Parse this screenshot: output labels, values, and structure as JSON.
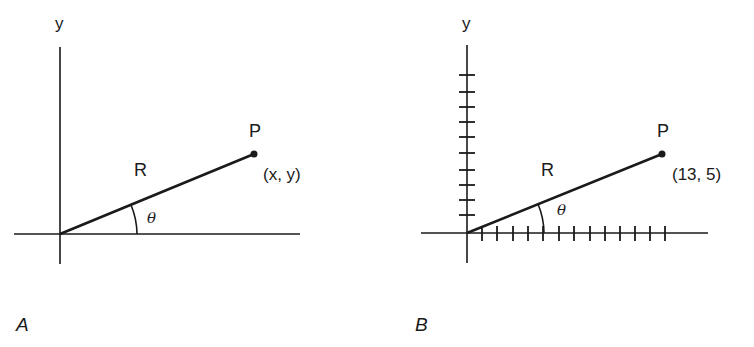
{
  "colors": {
    "ink": "#1a1a1a",
    "background": "#ffffff"
  },
  "panels": [
    {
      "id": "A",
      "panel_label": "A",
      "y_axis_label": "y",
      "point_label": "P",
      "coordinate_label": "(x, y)",
      "radius_label": "R",
      "angle_label": "θ",
      "origin": [
        60,
        234
      ],
      "point": [
        254,
        154
      ],
      "ticks": false
    },
    {
      "id": "B",
      "panel_label": "B",
      "y_axis_label": "y",
      "point_label": "P",
      "coordinate_label": "(13, 5)",
      "radius_label": "R",
      "angle_label": "θ",
      "origin": [
        467,
        233
      ],
      "point": [
        662,
        154
      ],
      "ticks": true,
      "x_tick_count": 13,
      "y_tick_count": 10,
      "tick_spacing": 15.25,
      "point_coords": {
        "x": 13,
        "y": 5
      }
    }
  ]
}
